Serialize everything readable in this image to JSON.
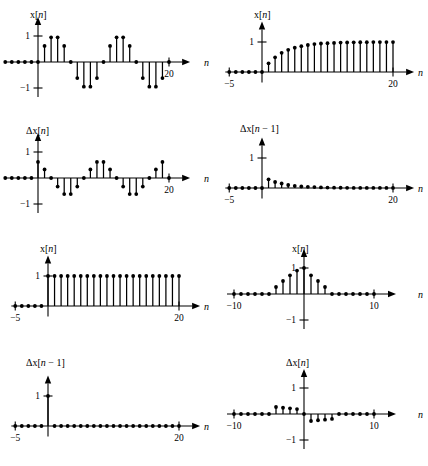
{
  "figure": {
    "title": "",
    "background": "#ffffff",
    "ink": "#000000",
    "panel_count": 8,
    "layout": {
      "rows": 4,
      "cols": 2
    }
  },
  "labels": {
    "x_of_n": "x[",
    "n_italic": "n",
    "bracket_close": "]",
    "delta_x_of_n": "Δx[",
    "delta_x_of_n_minus_1_tail": " − 1]",
    "axis_n": "n",
    "tick_one": "1",
    "tick_minus_one": "−1",
    "tick_twenty": "20",
    "tick_minus_five": "−5",
    "tick_ten": "10",
    "tick_minus_ten": "−10"
  },
  "chart_data": [
    {
      "id": "panel-1",
      "type": "stem",
      "ylabel": "x[n]",
      "xlabel": "n",
      "title": "",
      "grid": false,
      "legend": null,
      "xlim": [
        -5,
        22
      ],
      "ylim": [
        -1.35,
        1.35
      ],
      "yticks": [
        -1,
        1
      ],
      "ytick_labels": [
        "−1",
        "1"
      ],
      "xticks": [
        20
      ],
      "xtick_labels": [
        "20"
      ],
      "x": [
        -5,
        -4,
        -3,
        -2,
        -1,
        0,
        1,
        2,
        3,
        4,
        5,
        6,
        7,
        8,
        9,
        10,
        11,
        12,
        13,
        14,
        15,
        16,
        17,
        18,
        19,
        20
      ],
      "values": [
        0,
        0,
        0,
        0,
        0,
        0,
        0.62,
        0.95,
        0.95,
        0.62,
        0,
        -0.62,
        -0.95,
        -0.95,
        -0.62,
        0,
        0.62,
        0.95,
        0.95,
        0.62,
        0,
        -0.62,
        -0.95,
        -0.95,
        -0.62,
        0
      ]
    },
    {
      "id": "panel-2",
      "type": "stem",
      "ylabel": "x[n]",
      "xlabel": "n",
      "title": "",
      "grid": false,
      "legend": null,
      "xlim": [
        -5.6,
        22
      ],
      "ylim": [
        -0.35,
        1.35
      ],
      "yticks": [
        1
      ],
      "ytick_labels": [
        "1"
      ],
      "xticks": [
        -5,
        20
      ],
      "xtick_labels": [
        "−5",
        "20"
      ],
      "x": [
        -5,
        -4,
        -3,
        -2,
        -1,
        0,
        1,
        2,
        3,
        4,
        5,
        6,
        7,
        8,
        9,
        10,
        11,
        12,
        13,
        14,
        15,
        16,
        17,
        18,
        19,
        20
      ],
      "values": [
        0,
        0,
        0,
        0,
        0,
        0,
        0.29,
        0.49,
        0.64,
        0.74,
        0.81,
        0.86,
        0.9,
        0.93,
        0.95,
        0.96,
        0.97,
        0.98,
        0.985,
        0.99,
        0.992,
        0.994,
        0.996,
        0.997,
        0.998,
        0.999
      ]
    },
    {
      "id": "panel-3",
      "type": "stem",
      "ylabel": "Δx[n]",
      "xlabel": "n",
      "title": "",
      "grid": false,
      "legend": null,
      "xlim": [
        -5,
        22
      ],
      "ylim": [
        -1.35,
        1.35
      ],
      "yticks": [
        -1,
        1
      ],
      "ytick_labels": [
        "−1",
        "1"
      ],
      "xticks": [
        20
      ],
      "xtick_labels": [
        "20"
      ],
      "x": [
        -5,
        -4,
        -3,
        -2,
        -1,
        0,
        1,
        2,
        3,
        4,
        5,
        6,
        7,
        8,
        9,
        10,
        11,
        12,
        13,
        14,
        15,
        16,
        17,
        18,
        19,
        20
      ],
      "values": [
        0,
        0,
        0,
        0,
        0,
        0.62,
        0.33,
        0,
        -0.33,
        -0.62,
        -0.62,
        -0.33,
        0,
        0.33,
        0.62,
        0.62,
        0.33,
        0,
        -0.33,
        -0.62,
        -0.62,
        -0.33,
        0,
        0.33,
        0.62,
        0
      ]
    },
    {
      "id": "panel-4",
      "type": "stem",
      "ylabel": "Δx[n − 1]",
      "xlabel": "n",
      "title": "",
      "grid": false,
      "legend": null,
      "xlim": [
        -5.6,
        22
      ],
      "ylim": [
        -0.35,
        1.35
      ],
      "yticks": [
        1
      ],
      "ytick_labels": [
        "1"
      ],
      "xticks": [
        -5,
        20
      ],
      "xtick_labels": [
        "−5",
        "20"
      ],
      "x": [
        -5,
        -4,
        -3,
        -2,
        -1,
        0,
        1,
        2,
        3,
        4,
        5,
        6,
        7,
        8,
        9,
        10,
        11,
        12,
        13,
        14,
        15,
        16,
        17,
        18,
        19,
        20
      ],
      "values": [
        0,
        0,
        0,
        0,
        0,
        0,
        0.29,
        0.2,
        0.15,
        0.1,
        0.07,
        0.05,
        0.04,
        0.03,
        0.02,
        0.015,
        0.01,
        0.008,
        0.006,
        0.004,
        0.003,
        0.002,
        0.002,
        0.001,
        0.001,
        0.001
      ]
    },
    {
      "id": "panel-5",
      "type": "stem",
      "ylabel": "x[n]",
      "xlabel": "n",
      "title": "",
      "grid": false,
      "legend": null,
      "xlim": [
        -5.6,
        22
      ],
      "ylim": [
        -0.35,
        1.35
      ],
      "yticks": [
        1
      ],
      "ytick_labels": [
        "1"
      ],
      "xticks": [
        -5,
        20
      ],
      "xtick_labels": [
        "−5",
        "20"
      ],
      "x": [
        -5,
        -4,
        -3,
        -2,
        -1,
        0,
        1,
        2,
        3,
        4,
        5,
        6,
        7,
        8,
        9,
        10,
        11,
        12,
        13,
        14,
        15,
        16,
        17,
        18,
        19,
        20
      ],
      "values": [
        0,
        0,
        0,
        0,
        0,
        1,
        1,
        1,
        1,
        1,
        1,
        1,
        1,
        1,
        1,
        1,
        1,
        1,
        1,
        1,
        1,
        1,
        1,
        1,
        1,
        1
      ]
    },
    {
      "id": "panel-6",
      "type": "stem",
      "ylabel": "x[n]",
      "xlabel": "n",
      "title": "",
      "grid": false,
      "legend": null,
      "xlim": [
        -11,
        12
      ],
      "ylim": [
        -1.35,
        1.35
      ],
      "yticks": [
        -1,
        1
      ],
      "ytick_labels": [
        "−1",
        "1"
      ],
      "xticks": [
        -10,
        10
      ],
      "xtick_labels": [
        "−10",
        "10"
      ],
      "x": [
        -10,
        -9,
        -8,
        -7,
        -6,
        -5,
        -4,
        -3,
        -2,
        -1,
        0,
        1,
        2,
        3,
        4,
        5,
        6,
        7,
        8,
        9,
        10
      ],
      "values": [
        0,
        0,
        0,
        0,
        0,
        0,
        0.27,
        0.5,
        0.72,
        0.9,
        1.0,
        0.72,
        0.5,
        0.27,
        0,
        0,
        0,
        0,
        0,
        0,
        0
      ]
    },
    {
      "id": "panel-7",
      "type": "stem",
      "ylabel": "Δx[n − 1]",
      "xlabel": "n",
      "title": "",
      "grid": false,
      "legend": null,
      "xlim": [
        -5.6,
        22
      ],
      "ylim": [
        -0.35,
        1.35
      ],
      "yticks": [
        1
      ],
      "ytick_labels": [
        "1"
      ],
      "xticks": [
        -5,
        20
      ],
      "xtick_labels": [
        "−5",
        "20"
      ],
      "x": [
        -5,
        -4,
        -3,
        -2,
        -1,
        0,
        1,
        2,
        3,
        4,
        5,
        6,
        7,
        8,
        9,
        10,
        11,
        12,
        13,
        14,
        15,
        16,
        17,
        18,
        19,
        20
      ],
      "values": [
        0,
        0,
        0,
        0,
        0,
        1,
        0,
        0,
        0,
        0,
        0,
        0,
        0,
        0,
        0,
        0,
        0,
        0,
        0,
        0,
        0,
        0,
        0,
        0,
        0,
        0
      ]
    },
    {
      "id": "panel-8",
      "type": "stem",
      "ylabel": "Δx[n]",
      "xlabel": "n",
      "title": "",
      "grid": false,
      "legend": null,
      "xlim": [
        -11,
        12
      ],
      "ylim": [
        -1.35,
        1.35
      ],
      "yticks": [
        -1,
        1
      ],
      "ytick_labels": [
        "−1",
        "1"
      ],
      "xticks": [
        -10,
        10
      ],
      "xtick_labels": [
        "−10",
        "10"
      ],
      "x": [
        -10,
        -9,
        -8,
        -7,
        -6,
        -5,
        -4,
        -3,
        -2,
        -1,
        0,
        1,
        2,
        3,
        4,
        5,
        6,
        7,
        8,
        9,
        10
      ],
      "values": [
        0,
        0,
        0,
        0,
        0,
        0,
        0.27,
        0.24,
        0.22,
        0.19,
        0,
        -0.27,
        -0.24,
        -0.22,
        -0.19,
        0,
        0,
        0,
        0,
        0,
        0
      ]
    }
  ]
}
